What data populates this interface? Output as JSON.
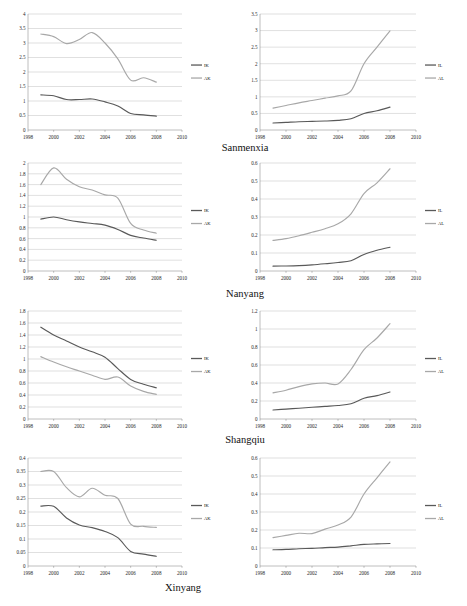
{
  "figure": {
    "panel_label_suffix": "",
    "cities": [
      "Sanmenxia",
      "Nanyang",
      "Shangqiu",
      "Xinyang"
    ]
  },
  "axis": {
    "x_ticks": [
      "1998",
      "2000",
      "2002",
      "2004",
      "2006",
      "2008",
      "2010"
    ],
    "x_min": 1998,
    "x_max": 2010
  },
  "legend": {
    "capital_dark": "IK",
    "capital_light": "AK",
    "labor_dark": "IL",
    "labor_light": "AL"
  },
  "chart_data": [
    {
      "type": "line",
      "title": "Sanmenxia capital",
      "city": "Sanmenxia",
      "position": "row1-left",
      "xlabel": "",
      "ylabel": "",
      "xlim": [
        1998,
        2010
      ],
      "ylim": [
        0,
        4
      ],
      "y_ticks": [
        "0",
        "0.5",
        "1",
        "1.5",
        "2",
        "2.5",
        "3",
        "3.5",
        "4"
      ],
      "grid": true,
      "legend_position": "right",
      "x": [
        1999,
        2000,
        2001,
        2002,
        2003,
        2004,
        2005,
        2006,
        2007,
        2008
      ],
      "series": [
        {
          "name": "IK",
          "color": "#595959",
          "values": [
            1.21,
            1.18,
            1.05,
            1.05,
            1.07,
            0.97,
            0.83,
            0.57,
            0.52,
            0.48
          ]
        },
        {
          "name": "AK",
          "color": "#a8a8a8",
          "values": [
            3.31,
            3.22,
            2.98,
            3.12,
            3.36,
            3.0,
            2.45,
            1.72,
            1.8,
            1.65
          ]
        }
      ]
    },
    {
      "type": "line",
      "title": "Sanmenxia labor",
      "city": "Sanmenxia",
      "position": "row1-right",
      "xlabel": "",
      "ylabel": "",
      "xlim": [
        1998,
        2010
      ],
      "ylim": [
        0,
        3.5
      ],
      "y_ticks": [
        "0",
        "0.5",
        "1",
        "1.5",
        "2",
        "2.5",
        "3",
        "3.5"
      ],
      "grid": true,
      "legend_position": "right",
      "x": [
        1999,
        2000,
        2001,
        2002,
        2003,
        2004,
        2005,
        2006,
        2007,
        2008
      ],
      "series": [
        {
          "name": "IL",
          "color": "#595959",
          "values": [
            0.21,
            0.23,
            0.25,
            0.26,
            0.27,
            0.29,
            0.34,
            0.5,
            0.58,
            0.69
          ]
        },
        {
          "name": "AL",
          "color": "#a8a8a8",
          "values": [
            0.66,
            0.74,
            0.82,
            0.89,
            0.96,
            1.03,
            1.18,
            2.0,
            2.5,
            2.99
          ]
        }
      ]
    },
    {
      "type": "line",
      "title": "Nanyang capital",
      "city": "Nanyang",
      "position": "row2-left",
      "xlabel": "",
      "ylabel": "",
      "xlim": [
        1998,
        2010
      ],
      "ylim": [
        0,
        2
      ],
      "y_ticks": [
        "0",
        "0.2",
        "0.4",
        "0.6",
        "0.8",
        "1",
        "1.2",
        "1.4",
        "1.6",
        "1.8",
        "2"
      ],
      "grid": true,
      "legend_position": "right",
      "x": [
        1999,
        2000,
        2001,
        2002,
        2003,
        2004,
        2005,
        2006,
        2007,
        2008
      ],
      "series": [
        {
          "name": "IK",
          "color": "#595959",
          "values": [
            0.96,
            1.0,
            0.95,
            0.91,
            0.88,
            0.85,
            0.77,
            0.66,
            0.61,
            0.57
          ]
        },
        {
          "name": "AK",
          "color": "#a8a8a8",
          "values": [
            1.6,
            1.91,
            1.7,
            1.56,
            1.5,
            1.41,
            1.35,
            0.88,
            0.76,
            0.7
          ]
        }
      ]
    },
    {
      "type": "line",
      "title": "Nanyang labor",
      "city": "Nanyang",
      "position": "row2-right",
      "xlabel": "",
      "ylabel": "",
      "xlim": [
        1998,
        2010
      ],
      "ylim": [
        0,
        0.6
      ],
      "y_ticks": [
        "0",
        "0.1",
        "0.2",
        "0.3",
        "0.4",
        "0.5",
        "0.6"
      ],
      "grid": true,
      "legend_position": "right",
      "x": [
        1999,
        2000,
        2001,
        2002,
        2003,
        2004,
        2005,
        2006,
        2007,
        2008
      ],
      "series": [
        {
          "name": "IL",
          "color": "#595959",
          "values": [
            0.027,
            0.028,
            0.03,
            0.034,
            0.04,
            0.047,
            0.057,
            0.092,
            0.115,
            0.132
          ]
        },
        {
          "name": "AL",
          "color": "#a8a8a8",
          "values": [
            0.17,
            0.18,
            0.196,
            0.215,
            0.235,
            0.262,
            0.318,
            0.43,
            0.49,
            0.568
          ]
        }
      ]
    },
    {
      "type": "line",
      "title": "Shangqiu capital",
      "city": "Shangqiu",
      "position": "row3-left",
      "xlabel": "",
      "ylabel": "",
      "xlim": [
        1998,
        2010
      ],
      "ylim": [
        0,
        1.8
      ],
      "y_ticks": [
        "0",
        "0.2",
        "0.4",
        "0.6",
        "0.8",
        "1",
        "1.2",
        "1.4",
        "1.6",
        "1.8"
      ],
      "grid": true,
      "legend_position": "right",
      "x": [
        1999,
        2000,
        2001,
        2002,
        2003,
        2004,
        2005,
        2006,
        2007,
        2008
      ],
      "series": [
        {
          "name": "IK",
          "color": "#595959",
          "values": [
            1.53,
            1.4,
            1.3,
            1.2,
            1.12,
            1.03,
            0.84,
            0.66,
            0.58,
            0.52
          ]
        },
        {
          "name": "AK",
          "color": "#a8a8a8",
          "values": [
            1.04,
            0.95,
            0.87,
            0.8,
            0.73,
            0.66,
            0.7,
            0.55,
            0.46,
            0.41
          ]
        }
      ]
    },
    {
      "type": "line",
      "title": "Shangqiu labor",
      "city": "Shangqiu",
      "position": "row3-right",
      "xlabel": "",
      "ylabel": "",
      "xlim": [
        1998,
        2010
      ],
      "ylim": [
        0,
        1.2
      ],
      "y_ticks": [
        "0",
        "0.2",
        "0.4",
        "0.6",
        "0.8",
        "1",
        "1.2"
      ],
      "grid": true,
      "legend_position": "right",
      "x": [
        1999,
        2000,
        2001,
        2002,
        2003,
        2004,
        2005,
        2006,
        2007,
        2008
      ],
      "series": [
        {
          "name": "IL",
          "color": "#595959",
          "values": [
            0.1,
            0.11,
            0.12,
            0.13,
            0.14,
            0.15,
            0.17,
            0.23,
            0.26,
            0.3
          ]
        },
        {
          "name": "AL",
          "color": "#a8a8a8",
          "values": [
            0.29,
            0.32,
            0.36,
            0.39,
            0.4,
            0.39,
            0.55,
            0.77,
            0.9,
            1.06
          ]
        }
      ]
    },
    {
      "type": "line",
      "title": "Xinyang capital",
      "city": "Xinyang",
      "position": "row4-left",
      "xlabel": "",
      "ylabel": "",
      "xlim": [
        1998,
        2010
      ],
      "ylim": [
        0,
        0.4
      ],
      "y_ticks": [
        "0",
        "0.05",
        "0.1",
        "0.15",
        "0.2",
        "0.25",
        "0.3",
        "0.35",
        "0.4"
      ],
      "grid": true,
      "legend_position": "right",
      "x": [
        1999,
        2000,
        2001,
        2002,
        2003,
        2004,
        2005,
        2006,
        2007,
        2008
      ],
      "series": [
        {
          "name": "IK",
          "color": "#595959",
          "values": [
            0.222,
            0.221,
            0.178,
            0.152,
            0.142,
            0.128,
            0.105,
            0.054,
            0.044,
            0.036
          ]
        },
        {
          "name": "AK",
          "color": "#a8a8a8",
          "values": [
            0.35,
            0.35,
            0.29,
            0.256,
            0.288,
            0.262,
            0.25,
            0.155,
            0.147,
            0.143
          ]
        }
      ]
    },
    {
      "type": "line",
      "title": "Xinyang labor",
      "city": "Xinyang",
      "position": "row4-right",
      "xlabel": "",
      "ylabel": "",
      "xlim": [
        1998,
        2010
      ],
      "ylim": [
        0,
        0.6
      ],
      "y_ticks": [
        "0",
        "0.1",
        "0.2",
        "0.3",
        "0.4",
        "0.5",
        "0.6"
      ],
      "grid": true,
      "legend_position": "right",
      "x": [
        1999,
        2000,
        2001,
        2002,
        2003,
        2004,
        2005,
        2006,
        2007,
        2008
      ],
      "series": [
        {
          "name": "IL",
          "color": "#595959",
          "values": [
            0.09,
            0.092,
            0.096,
            0.098,
            0.102,
            0.105,
            0.112,
            0.12,
            0.123,
            0.125
          ]
        },
        {
          "name": "AL",
          "color": "#a8a8a8",
          "values": [
            0.158,
            0.17,
            0.182,
            0.18,
            0.205,
            0.228,
            0.272,
            0.4,
            0.49,
            0.578
          ]
        }
      ]
    }
  ]
}
